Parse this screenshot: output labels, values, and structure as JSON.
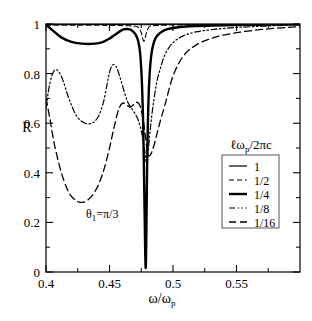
{
  "chart_data": {
    "type": "line",
    "title": "",
    "xlabel": "ω/ωp",
    "ylabel": "R",
    "xlim": [
      0.4,
      0.6
    ],
    "ylim": [
      0,
      1
    ],
    "grid": false,
    "xticks": [
      "0.4",
      "0.45",
      "0.5",
      "0.55"
    ],
    "xtick_values": [
      0.4,
      0.45,
      0.5,
      0.55
    ],
    "xminor_values": [
      0.425,
      0.475,
      0.525,
      0.575
    ],
    "yticks": [
      "0",
      "0.2",
      "0.4",
      "0.6",
      "0.8",
      "1"
    ],
    "ytick_values": [
      0,
      0.2,
      0.4,
      0.6,
      0.8,
      1.0
    ],
    "yminor_values": [
      0.1,
      0.3,
      0.5,
      0.7,
      0.9
    ],
    "legend_title": "ℓωp/2πc",
    "legend_position": "right-center",
    "annotation": "θ1=π/3",
    "annotation_x": 0.445,
    "annotation_y": 0.175,
    "series": [
      {
        "name": "1",
        "label": "1",
        "style": "solid-thin",
        "x": [
          0.4,
          0.41,
          0.42,
          0.43,
          0.44,
          0.45,
          0.46,
          0.47,
          0.476,
          0.478,
          0.48,
          0.484,
          0.49,
          0.5,
          0.52,
          0.55,
          0.58,
          0.6
        ],
        "values": [
          0.998,
          0.998,
          0.998,
          0.998,
          0.998,
          0.998,
          0.998,
          0.998,
          0.997,
          0.997,
          0.997,
          0.998,
          0.998,
          0.999,
          0.999,
          0.999,
          1.0,
          1.0
        ]
      },
      {
        "name": "1/2",
        "label": "1/2",
        "style": "dashed-thin",
        "x": [
          0.4,
          0.42,
          0.44,
          0.455,
          0.465,
          0.47,
          0.473,
          0.475,
          0.477,
          0.479,
          0.481,
          0.484,
          0.488,
          0.492,
          0.5,
          0.52,
          0.55,
          0.58,
          0.6
        ],
        "values": [
          0.995,
          0.995,
          0.995,
          0.994,
          0.993,
          0.991,
          0.985,
          0.965,
          0.93,
          0.962,
          0.988,
          0.993,
          0.994,
          0.995,
          0.996,
          0.997,
          0.998,
          0.999,
          0.999
        ]
      },
      {
        "name": "1/4",
        "label": "1/4",
        "style": "solid-thick",
        "x": [
          0.4,
          0.405,
          0.412,
          0.42,
          0.428,
          0.436,
          0.444,
          0.45,
          0.456,
          0.461,
          0.464,
          0.466,
          0.468,
          0.47,
          0.471,
          0.472,
          0.473,
          0.474,
          0.4745,
          0.4752,
          0.4757,
          0.4762,
          0.4766,
          0.477,
          0.4774,
          0.4778,
          0.4782,
          0.4786,
          0.479,
          0.4794,
          0.4798,
          0.4803,
          0.4808,
          0.4814,
          0.4822,
          0.4832,
          0.4845,
          0.4862,
          0.4885,
          0.4915,
          0.4955,
          0.501,
          0.508,
          0.518,
          0.532,
          0.55,
          0.57,
          0.59,
          0.6
        ],
        "values": [
          0.998,
          0.975,
          0.946,
          0.928,
          0.921,
          0.92,
          0.926,
          0.941,
          0.963,
          0.978,
          0.98,
          0.978,
          0.972,
          0.962,
          0.953,
          0.941,
          0.922,
          0.888,
          0.86,
          0.8,
          0.74,
          0.66,
          0.57,
          0.45,
          0.32,
          0.185,
          0.06,
          0.02,
          0.15,
          0.33,
          0.49,
          0.62,
          0.71,
          0.78,
          0.84,
          0.885,
          0.918,
          0.942,
          0.958,
          0.97,
          0.979,
          0.985,
          0.989,
          0.992,
          0.994,
          0.996,
          0.997,
          0.998,
          0.999
        ]
      },
      {
        "name": "1/8",
        "label": "1/8",
        "style": "dashdot",
        "x": [
          0.4,
          0.403,
          0.407,
          0.412,
          0.418,
          0.424,
          0.43,
          0.436,
          0.441,
          0.445,
          0.448,
          0.45,
          0.452,
          0.454,
          0.456,
          0.458,
          0.46,
          0.462,
          0.464,
          0.466,
          0.468,
          0.47,
          0.472,
          0.474,
          0.476,
          0.478,
          0.479,
          0.4805,
          0.482,
          0.484,
          0.487,
          0.49,
          0.494,
          0.5,
          0.508,
          0.518,
          0.532,
          0.55,
          0.57,
          0.59,
          0.6
        ],
        "values": [
          0.66,
          0.76,
          0.815,
          0.79,
          0.7,
          0.63,
          0.602,
          0.6,
          0.625,
          0.68,
          0.755,
          0.805,
          0.832,
          0.835,
          0.82,
          0.79,
          0.755,
          0.72,
          0.69,
          0.67,
          0.655,
          0.64,
          0.62,
          0.59,
          0.545,
          0.48,
          0.44,
          0.49,
          0.57,
          0.66,
          0.76,
          0.82,
          0.88,
          0.925,
          0.952,
          0.968,
          0.978,
          0.986,
          0.991,
          0.995,
          0.996
        ]
      },
      {
        "name": "1/16",
        "label": "1/16",
        "style": "dashed-long",
        "x": [
          0.4,
          0.403,
          0.406,
          0.41,
          0.414,
          0.418,
          0.422,
          0.426,
          0.43,
          0.434,
          0.438,
          0.442,
          0.446,
          0.45,
          0.453,
          0.456,
          0.458,
          0.46,
          0.462,
          0.464,
          0.466,
          0.468,
          0.47,
          0.472,
          0.474,
          0.476,
          0.478,
          0.48,
          0.482,
          0.485,
          0.489,
          0.494,
          0.5,
          0.508,
          0.518,
          0.532,
          0.55,
          0.57,
          0.59,
          0.6
        ],
        "values": [
          0.7,
          0.62,
          0.53,
          0.44,
          0.37,
          0.32,
          0.295,
          0.282,
          0.282,
          0.295,
          0.32,
          0.36,
          0.42,
          0.5,
          0.57,
          0.635,
          0.665,
          0.68,
          0.68,
          0.672,
          0.665,
          0.67,
          0.68,
          0.684,
          0.67,
          0.63,
          0.56,
          0.48,
          0.47,
          0.51,
          0.59,
          0.68,
          0.79,
          0.87,
          0.915,
          0.945,
          0.965,
          0.978,
          0.986,
          0.989
        ]
      }
    ]
  },
  "axis": {
    "ylabel_text": "R",
    "xlabel_main": "ω/ω",
    "xlabel_sub": "p"
  },
  "legend": {
    "title_lead": "ℓω",
    "title_sub": "p",
    "title_tail": "/2πc",
    "entries": [
      {
        "label": "1",
        "style": "solid-thin"
      },
      {
        "label": "1/2",
        "style": "dashed-thin"
      },
      {
        "label": "1/4",
        "style": "solid-thick"
      },
      {
        "label": "1/8",
        "style": "dashdot"
      },
      {
        "label": "1/16",
        "style": "dashed-long"
      }
    ]
  },
  "annotation": {
    "theta": "θ",
    "sub": "1",
    "eq": "=π/3"
  },
  "colors": {
    "line": "#000000",
    "frame": "#000000",
    "background": "#ffffff"
  }
}
